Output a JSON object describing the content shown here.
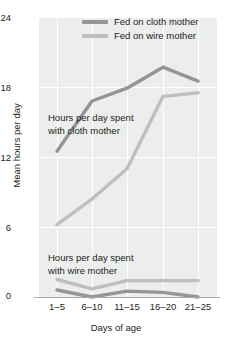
{
  "chart_data": {
    "type": "line",
    "title": "",
    "xlabel": "Days of age",
    "ylabel": "Mean hours per day",
    "categories": [
      "1–5",
      "6–10",
      "11–15",
      "16–20",
      "21–25"
    ],
    "ylim": [
      0,
      24
    ],
    "yticks": [
      0,
      6,
      12,
      18,
      24
    ],
    "grid": true,
    "legend_position": "top-right",
    "series": [
      {
        "name": "Hours with cloth mother — fed on cloth mother",
        "legend": "Fed on cloth mother",
        "color": "#939598",
        "values": [
          12.5,
          16.8,
          17.9,
          19.7,
          18.5
        ]
      },
      {
        "name": "Hours with cloth mother — fed on wire mother",
        "legend": "Fed on wire mother",
        "color": "#bcbec0",
        "values": [
          6.2,
          8.4,
          11.0,
          17.2,
          17.5
        ]
      },
      {
        "name": "Hours with wire mother — fed on wire mother",
        "legend": "Fed on wire mother",
        "color": "#bcbec0",
        "values": [
          1.5,
          0.7,
          1.4,
          1.4,
          1.4
        ]
      },
      {
        "name": "Hours with wire mother — fed on cloth mother",
        "legend": "Fed on cloth mother",
        "color": "#939598",
        "values": [
          0.6,
          0.0,
          0.5,
          0.4,
          0.0
        ]
      }
    ],
    "annotations": [
      {
        "id": "cloth",
        "line1": "Hours per day spent",
        "line2": "with cloth mother"
      },
      {
        "id": "wire",
        "line1": "Hours per day spent",
        "line2": "with wire mother"
      }
    ]
  },
  "legend": {
    "items": [
      {
        "label": "Fed on cloth mother",
        "color": "#939598"
      },
      {
        "label": "Fed on wire mother",
        "color": "#bcbec0"
      }
    ]
  },
  "axes": {
    "y_title": "Mean hours per day",
    "x_title": "Days of age",
    "y_labels": [
      "24",
      "18",
      "12",
      "6",
      "0"
    ],
    "x_labels": [
      "1–5",
      "6–10",
      "11–15",
      "16–20",
      "21–25"
    ]
  },
  "colors": {
    "plot_background": "#eceded",
    "gridline": "#ffffff",
    "axis": "#a9a9a9",
    "text": "#231f20",
    "series_dark": "#939598",
    "series_light": "#bcbec0"
  }
}
